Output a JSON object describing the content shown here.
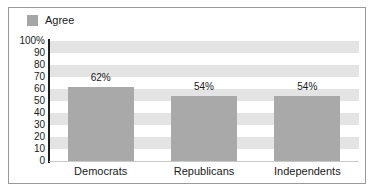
{
  "chart_data": {
    "type": "bar",
    "title": "",
    "subtitle": "",
    "xlabel": "",
    "ylabel": "",
    "categories": [
      "Democrats",
      "Republicans",
      "Independents"
    ],
    "values": [
      62,
      54,
      54
    ],
    "value_labels": [
      "62%",
      "54%",
      "54%"
    ],
    "series": [
      {
        "name": "Agree",
        "values": [
          62,
          54,
          54
        ]
      }
    ],
    "ylim": [
      0,
      100
    ],
    "ytick_labels": [
      "100%",
      "90",
      "80",
      "70",
      "60",
      "50",
      "40",
      "30",
      "20",
      "10",
      "0"
    ],
    "ytick_values": [
      100,
      90,
      80,
      70,
      60,
      50,
      40,
      30,
      20,
      10,
      0
    ],
    "grid": "horizontal-banded",
    "legend": {
      "position": "top-left",
      "entries": [
        {
          "label": "Agree",
          "color": "#a6a6a6"
        }
      ]
    },
    "colors": {
      "bar": "#a9a9a9",
      "band": "#e4e4e4",
      "axis": "#1c1c1c",
      "frame": "#9a9a9a",
      "text": "#1a1a1a",
      "background": "#ffffff"
    }
  }
}
